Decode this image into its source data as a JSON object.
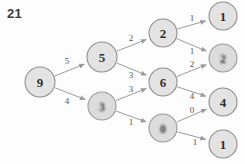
{
  "figure": {
    "number": "21"
  },
  "graph": {
    "type": "minimax-game-tree",
    "nodes": [
      {
        "id": "root",
        "label": "9",
        "x": 40,
        "y": 82,
        "r": 15,
        "blurred": false
      },
      {
        "id": "n5",
        "label": "5",
        "x": 102,
        "y": 57,
        "r": 15,
        "blurred": false
      },
      {
        "id": "n3",
        "label": "3",
        "x": 102,
        "y": 106,
        "r": 14,
        "blurred": true
      },
      {
        "id": "n2",
        "label": "2",
        "x": 163,
        "y": 33,
        "r": 14,
        "blurred": false
      },
      {
        "id": "n6",
        "label": "6",
        "x": 163,
        "y": 82,
        "r": 14,
        "blurred": false
      },
      {
        "id": "n0",
        "label": "0",
        "x": 163,
        "y": 128,
        "r": 14,
        "blurred": true
      },
      {
        "id": "leaf1",
        "label": "1",
        "x": 223,
        "y": 16,
        "r": 14,
        "blurred": false
      },
      {
        "id": "leaf2",
        "label": "2",
        "x": 223,
        "y": 58,
        "r": 14,
        "blurred": true
      },
      {
        "id": "leaf3",
        "label": "4",
        "x": 223,
        "y": 102,
        "r": 14,
        "blurred": false
      },
      {
        "id": "leaf4",
        "label": "1",
        "x": 223,
        "y": 144,
        "r": 14,
        "blurred": false
      }
    ],
    "edges": [
      {
        "from": "root",
        "to": "n5",
        "label": "5",
        "lx": 67,
        "ly": 61
      },
      {
        "from": "root",
        "to": "n3",
        "label": "4",
        "lx": 67,
        "ly": 101
      },
      {
        "from": "n5",
        "to": "n2",
        "label": "2",
        "lx": 131,
        "ly": 38
      },
      {
        "from": "n5",
        "to": "n6",
        "label": "3",
        "lx": 131,
        "ly": 75
      },
      {
        "from": "n3",
        "to": "n6",
        "label": "3",
        "lx": 131,
        "ly": 89
      },
      {
        "from": "n3",
        "to": "n0",
        "label": "1",
        "lx": 131,
        "ly": 122
      },
      {
        "from": "n2",
        "to": "leaf1",
        "label": "1",
        "lx": 192,
        "ly": 18
      },
      {
        "from": "n2",
        "to": "leaf2",
        "label": "1",
        "lx": 192,
        "ly": 51
      },
      {
        "from": "n6",
        "to": "leaf2",
        "label": "2",
        "lx": 192,
        "ly": 64
      },
      {
        "from": "n6",
        "to": "leaf3",
        "label": "4",
        "lx": 192,
        "ly": 96
      },
      {
        "from": "n0",
        "to": "leaf3",
        "label": "0",
        "lx": 192,
        "ly": 110
      },
      {
        "from": "n0",
        "to": "leaf4",
        "label": "1",
        "lx": 195,
        "ly": 142
      }
    ]
  }
}
